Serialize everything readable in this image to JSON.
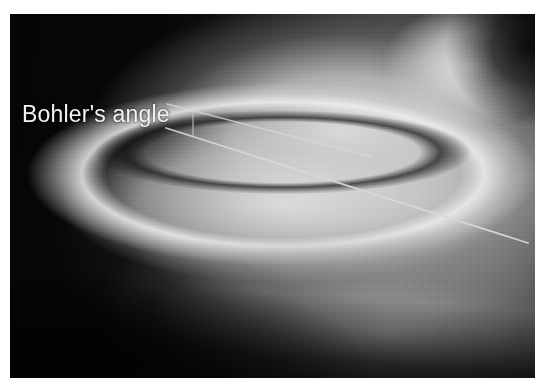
{
  "figure": {
    "kind": "radiograph",
    "modality": "X-ray",
    "view": "lateral foot / ankle",
    "border_color": "#ffffff",
    "film_background": "#070707"
  },
  "annotations": {
    "label": {
      "text": "Bohler's angle",
      "color": "#f2f2f2",
      "x": 12,
      "y": 101
    },
    "lines": [
      {
        "name": "superior-line",
        "description": "line from posterior tuberosity to highest point of posterior facet",
        "x1": 167,
        "y1": 104,
        "x2": 372,
        "y2": 157,
        "color": "#d8d8d8",
        "width": 1.6
      },
      {
        "name": "inferior-line",
        "description": "line from highest point of posterior facet to superior anterior process, extended distally",
        "x1": 166,
        "y1": 128,
        "x2": 528,
        "y2": 243,
        "color": "#d8d8d8",
        "width": 1.8
      },
      {
        "name": "vertex-tick",
        "description": "short vertical tick joining the two limbs",
        "x1": 193,
        "y1": 111,
        "x2": 193,
        "y2": 136,
        "color": "#cccccc",
        "width": 1.2
      }
    ]
  },
  "anatomy": {
    "structures": [
      "talar dome",
      "calcaneal body",
      "posterior facet",
      "anterior process",
      "sinus tarsi"
    ]
  }
}
